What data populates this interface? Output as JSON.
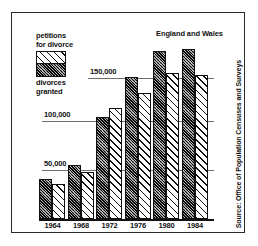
{
  "title": "England and Wales",
  "source_note": "Source: Office of Population Censuses and Surveys",
  "legend": {
    "top_label_line1": "petitions",
    "top_label_line2": "for divorce",
    "bottom_label_line1": "divorces",
    "bottom_label_line2": "granted",
    "swatch_top_name": "petitions-hatch",
    "swatch_bottom_name": "granted-hatch"
  },
  "colors": {
    "frame": "#2a2a2a",
    "gridline": "#6e6e6e",
    "axis": "#111111",
    "petitions_fill": "#4a4a4a",
    "granted_fill": "#ffffff",
    "text": "#111111"
  },
  "gridlines": [
    {
      "label": "150,000",
      "value": 150000
    },
    {
      "label": "100,000",
      "value": 100000
    },
    {
      "label": "50,000",
      "value": 50000
    }
  ],
  "chart_data": {
    "type": "bar",
    "title": "England and Wales",
    "subtitle": "",
    "xlabel": "",
    "ylabel": "",
    "categories": [
      "1964",
      "1968",
      "1972",
      "1976",
      "1980",
      "1984"
    ],
    "series": [
      {
        "name": "petitions for divorce",
        "values": [
          40000,
          55000,
          103000,
          144000,
          170000,
          172000
        ]
      },
      {
        "name": "divorces granted",
        "values": [
          35000,
          48000,
          112000,
          127000,
          148000,
          146000
        ]
      }
    ],
    "ylim": [
      0,
      190000
    ],
    "ytick_labels": [
      "50,000",
      "100,000",
      "150,000"
    ],
    "ytick_values": [
      50000,
      100000,
      150000
    ],
    "grid": true,
    "legend_position": "top-left",
    "annotations": [
      "England and Wales",
      "Source: Office of Population Censuses and Surveys"
    ]
  }
}
